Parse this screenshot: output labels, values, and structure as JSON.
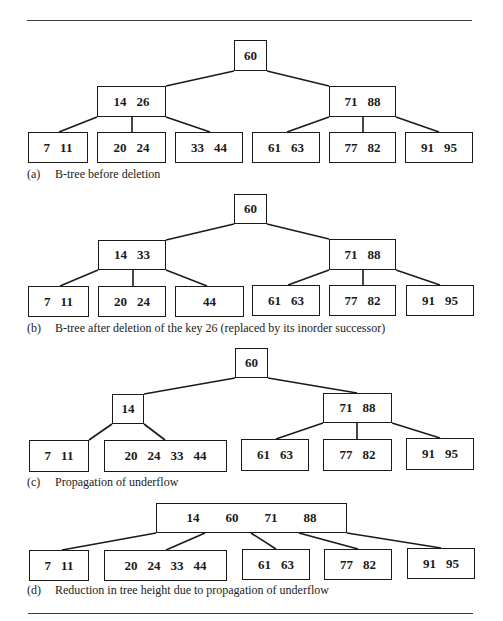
{
  "rules": [
    {
      "x1": 27,
      "x2": 472,
      "y": 20
    },
    {
      "x1": 28,
      "x2": 473,
      "y": 613
    }
  ],
  "colors": {
    "ink": "#1a1a1a",
    "paper": "#ffffff"
  },
  "panels": [
    {
      "id": "a",
      "caption_tag": "(a)",
      "caption_text": "B-tree before deletion",
      "caption_y": 167,
      "nodes": [
        {
          "id": "root",
          "keys": [
            "60"
          ],
          "x": 234,
          "y": 40,
          "w": 33,
          "h": 31,
          "gap": 0
        },
        {
          "id": "L",
          "keys": [
            "14",
            "26"
          ],
          "x": 97,
          "y": 86,
          "w": 69,
          "h": 31,
          "gap": 10
        },
        {
          "id": "R",
          "keys": [
            "71",
            "88"
          ],
          "x": 329,
          "y": 86,
          "w": 67,
          "h": 31,
          "gap": 10
        },
        {
          "id": "l1",
          "keys": [
            "7",
            "11"
          ],
          "x": 28,
          "y": 132,
          "w": 60,
          "h": 31,
          "gap": 10
        },
        {
          "id": "l2",
          "keys": [
            "20",
            "24"
          ],
          "x": 97,
          "y": 132,
          "w": 69,
          "h": 31,
          "gap": 10
        },
        {
          "id": "l3",
          "keys": [
            "33",
            "44"
          ],
          "x": 175,
          "y": 132,
          "w": 68,
          "h": 31,
          "gap": 10
        },
        {
          "id": "l4",
          "keys": [
            "61",
            "63"
          ],
          "x": 252,
          "y": 132,
          "w": 68,
          "h": 31,
          "gap": 10
        },
        {
          "id": "l5",
          "keys": [
            "77",
            "82"
          ],
          "x": 329,
          "y": 132,
          "w": 67,
          "h": 31,
          "gap": 10
        },
        {
          "id": "l6",
          "keys": [
            "91",
            "95"
          ],
          "x": 405,
          "y": 132,
          "w": 68,
          "h": 31,
          "gap": 10
        }
      ],
      "edges": [
        [
          234,
          71,
          166,
          86
        ],
        [
          267,
          71,
          329,
          86
        ],
        [
          97,
          117,
          59,
          132
        ],
        [
          132,
          117,
          132,
          132
        ],
        [
          166,
          117,
          210,
          132
        ],
        [
          329,
          117,
          287,
          132
        ],
        [
          363,
          117,
          363,
          132
        ],
        [
          396,
          117,
          439,
          132
        ]
      ]
    },
    {
      "id": "b",
      "caption_tag": "(b)",
      "caption_text": "B-tree after deletion of the key 26 (replaced by its inorder successor)",
      "caption_y": 321,
      "nodes": [
        {
          "id": "root",
          "keys": [
            "60"
          ],
          "x": 234,
          "y": 194,
          "w": 33,
          "h": 30,
          "gap": 0
        },
        {
          "id": "L",
          "keys": [
            "14",
            "33"
          ],
          "x": 98,
          "y": 240,
          "w": 68,
          "h": 30,
          "gap": 10
        },
        {
          "id": "R",
          "keys": [
            "71",
            "88"
          ],
          "x": 329,
          "y": 239,
          "w": 67,
          "h": 31,
          "gap": 10
        },
        {
          "id": "l1",
          "keys": [
            "7",
            "11"
          ],
          "x": 28,
          "y": 286,
          "w": 61,
          "h": 31,
          "gap": 10
        },
        {
          "id": "l2",
          "keys": [
            "20",
            "24"
          ],
          "x": 98,
          "y": 286,
          "w": 68,
          "h": 31,
          "gap": 10
        },
        {
          "id": "l3",
          "keys": [
            "44"
          ],
          "x": 175,
          "y": 286,
          "w": 69,
          "h": 31,
          "gap": 0
        },
        {
          "id": "l4",
          "keys": [
            "61",
            "63"
          ],
          "x": 252,
          "y": 285,
          "w": 68,
          "h": 31,
          "gap": 10
        },
        {
          "id": "l5",
          "keys": [
            "77",
            "82"
          ],
          "x": 329,
          "y": 285,
          "w": 67,
          "h": 31,
          "gap": 10
        },
        {
          "id": "l6",
          "keys": [
            "91",
            "95"
          ],
          "x": 406,
          "y": 285,
          "w": 68,
          "h": 31,
          "gap": 10
        }
      ],
      "edges": [
        [
          234,
          224,
          166,
          240
        ],
        [
          267,
          224,
          329,
          239
        ],
        [
          98,
          270,
          60,
          286
        ],
        [
          133,
          270,
          133,
          286
        ],
        [
          166,
          270,
          207,
          286
        ],
        [
          329,
          270,
          288,
          285
        ],
        [
          363,
          270,
          363,
          285
        ],
        [
          396,
          270,
          440,
          285
        ]
      ]
    },
    {
      "id": "c",
      "caption_tag": "(c)",
      "caption_text": "Propagation of underflow",
      "caption_y": 475,
      "nodes": [
        {
          "id": "root",
          "keys": [
            "60"
          ],
          "x": 235,
          "y": 348,
          "w": 33,
          "h": 30,
          "gap": 0
        },
        {
          "id": "L",
          "keys": [
            "14"
          ],
          "x": 112,
          "y": 394,
          "w": 32,
          "h": 30,
          "gap": 0
        },
        {
          "id": "R",
          "keys": [
            "71",
            "88"
          ],
          "x": 323,
          "y": 393,
          "w": 69,
          "h": 30,
          "gap": 10
        },
        {
          "id": "l1",
          "keys": [
            "7",
            "11"
          ],
          "x": 29,
          "y": 440,
          "w": 60,
          "h": 32,
          "gap": 10
        },
        {
          "id": "l2",
          "keys": [
            "20",
            "24",
            "33",
            "44"
          ],
          "x": 104,
          "y": 440,
          "w": 123,
          "h": 32,
          "gap": 10
        },
        {
          "id": "l4",
          "keys": [
            "61",
            "63"
          ],
          "x": 241,
          "y": 439,
          "w": 68,
          "h": 32,
          "gap": 10
        },
        {
          "id": "l5",
          "keys": [
            "77",
            "82"
          ],
          "x": 323,
          "y": 439,
          "w": 69,
          "h": 32,
          "gap": 10
        },
        {
          "id": "l6",
          "keys": [
            "91",
            "95"
          ],
          "x": 406,
          "y": 438,
          "w": 68,
          "h": 32,
          "gap": 10
        }
      ],
      "edges": [
        [
          235,
          378,
          144,
          394
        ],
        [
          268,
          378,
          357,
          393
        ],
        [
          112,
          424,
          89,
          440
        ],
        [
          144,
          424,
          165,
          440
        ],
        [
          323,
          423,
          276,
          439
        ],
        [
          357,
          423,
          357,
          439
        ],
        [
          392,
          423,
          440,
          438
        ]
      ]
    },
    {
      "id": "d",
      "caption_tag": "(d)",
      "caption_text": "Reduction in tree height due to propagation of underflow",
      "caption_y": 583,
      "nodes": [
        {
          "id": "root",
          "keys": [
            "14",
            "60",
            "71",
            "88"
          ],
          "x": 156,
          "y": 503,
          "w": 191,
          "h": 30,
          "gap": 26
        },
        {
          "id": "l1",
          "keys": [
            "7",
            "11"
          ],
          "x": 29,
          "y": 550,
          "w": 60,
          "h": 31,
          "gap": 10
        },
        {
          "id": "l2",
          "keys": [
            "20",
            "24",
            "33",
            "44"
          ],
          "x": 104,
          "y": 550,
          "w": 123,
          "h": 31,
          "gap": 10
        },
        {
          "id": "l4",
          "keys": [
            "61",
            "63"
          ],
          "x": 242,
          "y": 549,
          "w": 68,
          "h": 31,
          "gap": 10
        },
        {
          "id": "l5",
          "keys": [
            "77",
            "82"
          ],
          "x": 324,
          "y": 549,
          "w": 68,
          "h": 31,
          "gap": 10
        },
        {
          "id": "l6",
          "keys": [
            "91",
            "95"
          ],
          "x": 407,
          "y": 548,
          "w": 68,
          "h": 31,
          "gap": 10
        }
      ],
      "edges": [
        [
          156,
          533,
          62,
          550
        ],
        [
          205,
          533,
          166,
          550
        ],
        [
          251,
          533,
          276,
          549
        ],
        [
          299,
          533,
          358,
          549
        ],
        [
          347,
          533,
          441,
          548
        ]
      ]
    }
  ]
}
